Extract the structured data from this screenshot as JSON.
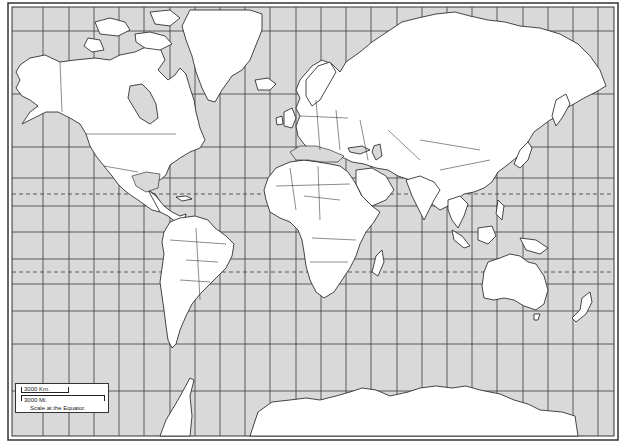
{
  "map": {
    "type": "blank political world map",
    "projection": "Mercator",
    "colors": {
      "ocean": "#d9d9d9",
      "land": "#ffffff",
      "inland_sea": "#d9d9d9",
      "outline": "#1a1a1a",
      "grid": "#3a3a3a",
      "frame": "#333333"
    },
    "grid": {
      "meridians_x": [
        43,
        69,
        94,
        119,
        144,
        170,
        195,
        220,
        245,
        270,
        296,
        321,
        346,
        371,
        397,
        422,
        447,
        472,
        497,
        523,
        548,
        573,
        598
      ],
      "parallels_y": [
        31,
        94,
        147,
        178,
        206,
        232,
        259,
        284,
        311,
        344,
        391
      ],
      "dashed_parallels_y": [
        194,
        272
      ],
      "dashed_labels": [
        "Tropic of Cancer",
        "Tropic of Capricorn"
      ]
    }
  },
  "scale": {
    "km_label": "3000 Km.",
    "mi_label": "3000 Mi.",
    "caption": "Scale at the Equator."
  }
}
